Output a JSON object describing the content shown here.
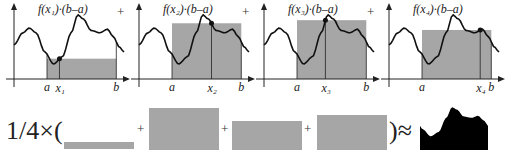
{
  "panels": [
    {
      "title": "f(x₁)·(b–a)",
      "a_label": "a",
      "b_label": "b",
      "x_label": "x₁",
      "sample_t": 0.18
    },
    {
      "title": "f(x₂)·(b–a)",
      "a_label": "a",
      "b_label": "b",
      "x_label": "x₂",
      "sample_t": 0.57
    },
    {
      "title": "f(x₃)·(b–a)",
      "a_label": "a",
      "b_label": "b",
      "x_label": "x₃",
      "sample_t": 0.41
    },
    {
      "title": "f(x₄)·(b–a)",
      "a_label": "a",
      "b_label": "b",
      "x_label": "x₄",
      "sample_t": 0.84
    }
  ],
  "plus_sign": "+",
  "equation": {
    "prefix": "1/4×(",
    "plus": "+",
    "suffix": ")≈",
    "rect_heights": [
      0.12,
      1.0,
      0.58,
      0.76
    ]
  },
  "colors": {
    "fill": "#a6a6a6",
    "curve": "#111111",
    "axis": "#222222",
    "area": "#000000"
  }
}
